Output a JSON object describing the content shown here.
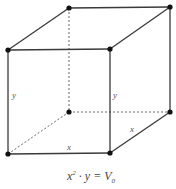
{
  "diagram": {
    "labels": {
      "front_left_height": "y",
      "front_right_height": "y",
      "front_bottom_width": "x",
      "right_bottom_depth": "x"
    },
    "formula": {
      "base": "x",
      "exponent": "2",
      "dot": " · ",
      "var": "y",
      "equals": " = ",
      "rhs": "V",
      "rhs_subscript": "0"
    },
    "colors": {
      "edge": "#3a3a3a",
      "hidden_edge": "#555555",
      "vertex": "#111111"
    }
  }
}
